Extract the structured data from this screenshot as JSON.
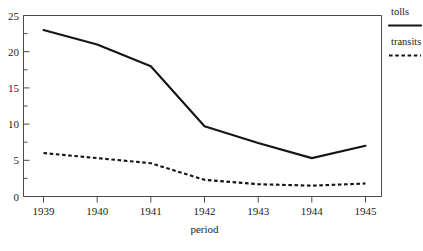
{
  "chart_data": {
    "type": "line",
    "title": "",
    "xlabel": "period",
    "ylabel": "",
    "categories": [
      "1939",
      "1940",
      "1941",
      "1942",
      "1943",
      "1944",
      "1945"
    ],
    "x": [
      1939,
      1940,
      1941,
      1942,
      1943,
      1944,
      1945
    ],
    "series": [
      {
        "name": "tolls",
        "style": "solid",
        "values": [
          23.0,
          21.0,
          18.0,
          9.7,
          7.4,
          5.3,
          7.0
        ]
      },
      {
        "name": "transits",
        "style": "dashed",
        "values": [
          6.0,
          5.3,
          4.6,
          2.3,
          1.7,
          1.5,
          1.8
        ]
      }
    ],
    "xlim": [
      1939,
      1945
    ],
    "ylim": [
      0,
      25
    ],
    "yticks": [
      0,
      5,
      10,
      15,
      20,
      25
    ],
    "ytick_labels": [
      "0",
      "5",
      "10",
      "15",
      "20",
      "25"
    ],
    "yminor_ticks": [
      2.5,
      7.5,
      12.5,
      17.5,
      22.5
    ],
    "xticks": [
      1939,
      1940,
      1941,
      1942,
      1943,
      1944,
      1945
    ],
    "grid": false,
    "legend_position": "right-outside",
    "legend_entries": [
      {
        "label": "tolls",
        "style": "solid"
      },
      {
        "label": "transits",
        "style": "dashed"
      }
    ],
    "colors": {
      "line": "#151515",
      "axis": "#4a4a4a",
      "background": "#ffffff",
      "text": "#1d1d1d"
    }
  },
  "axis": {
    "x_title": "period",
    "y_labels": [
      "25",
      "20",
      "15",
      "10",
      "5",
      "0"
    ],
    "x_labels": [
      "1939",
      "1940",
      "1941",
      "1942",
      "1943",
      "1944",
      "1945"
    ]
  },
  "legend": {
    "tolls_label": "tolls",
    "transits_label": "transits"
  }
}
